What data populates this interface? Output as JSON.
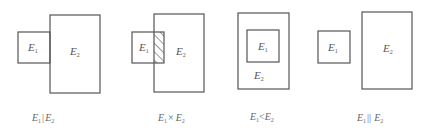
{
  "diagrams": [
    {
      "id": "exclusive",
      "caption": {
        "a": "E",
        "a_sub": "1",
        "op": "|",
        "b": "E",
        "b_sub": "2"
      },
      "e1": {
        "label": "E",
        "sub": "1"
      },
      "e2": {
        "label": "E",
        "sub": "2"
      }
    },
    {
      "id": "overlap",
      "caption": {
        "a": "E",
        "a_sub": "1",
        "op": "×",
        "b": "E",
        "b_sub": "2"
      },
      "e1": {
        "label": "E",
        "sub": "1"
      },
      "e2": {
        "label": "E",
        "sub": "2"
      }
    },
    {
      "id": "contained",
      "caption": {
        "a": "E",
        "a_sub": "1",
        "op": "<",
        "b": "E",
        "b_sub": "2"
      },
      "e1": {
        "label": "E",
        "sub": "1"
      },
      "e2": {
        "label": "E",
        "sub": "2"
      }
    },
    {
      "id": "disjoint",
      "caption": {
        "a": "E",
        "a_sub": "1",
        "op": "||",
        "b": "E",
        "b_sub": "2"
      },
      "e1": {
        "label": "E",
        "sub": "1"
      },
      "e2": {
        "label": "E",
        "sub": "2"
      }
    }
  ],
  "colors": {
    "stroke": "#555555",
    "text": "#555555",
    "background": "#ffffff"
  }
}
